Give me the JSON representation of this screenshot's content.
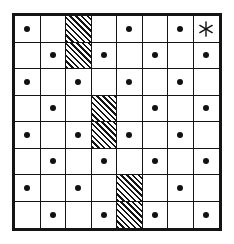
{
  "figure": {
    "type": "puzzle-grid",
    "rows": 8,
    "columns": 8,
    "background_color": "#ffffff",
    "line_color": "#141414",
    "mark_color": "#111111",
    "marks": {
      "dot": "dot-marker",
      "hatch": "diagonal-hatch-fill",
      "star": "asterisk-star-icon",
      "empty": "empty-cell"
    },
    "grid": [
      [
        "dot",
        "empty",
        "hatch",
        "empty",
        "dot",
        "empty",
        "dot",
        "star"
      ],
      [
        "empty",
        "dot",
        "hatch",
        "dot",
        "empty",
        "dot",
        "empty",
        "dot"
      ],
      [
        "dot",
        "empty",
        "dot",
        "empty",
        "dot",
        "empty",
        "dot",
        "empty"
      ],
      [
        "empty",
        "dot",
        "empty",
        "hatch",
        "empty",
        "dot",
        "empty",
        "dot"
      ],
      [
        "dot",
        "empty",
        "dot",
        "hatch",
        "dot",
        "empty",
        "dot",
        "empty"
      ],
      [
        "empty",
        "dot",
        "empty",
        "dot",
        "empty",
        "dot",
        "empty",
        "dot"
      ],
      [
        "dot",
        "empty",
        "dot",
        "empty",
        "hatch",
        "empty",
        "dot",
        "empty"
      ],
      [
        "empty",
        "dot",
        "empty",
        "dot",
        "hatch",
        "dot",
        "empty",
        "dot"
      ]
    ],
    "counts": {
      "dots": 29,
      "hatched": 6,
      "stars": 1,
      "empty": 28
    },
    "star_position": {
      "row": 1,
      "column": 8
    }
  }
}
